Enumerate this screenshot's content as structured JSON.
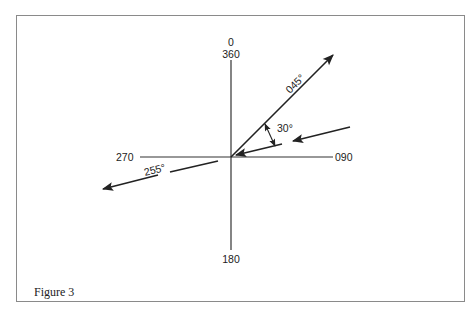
{
  "figure": {
    "caption": "Figure 3",
    "compass_labels": {
      "north_top": "0",
      "north_bottom": "360",
      "east": "090",
      "south": "180",
      "west": "270"
    },
    "vectors": [
      {
        "label": "045°",
        "bearing": 45,
        "direction": "outward from origin"
      },
      {
        "label": "255°",
        "bearing": 255,
        "direction": "outward from origin (dashed)"
      },
      {
        "label": "incoming",
        "bearing": 75,
        "direction": "toward origin (dashed)"
      }
    ],
    "angle_annotation": "30°",
    "colors": {
      "ink": "#222222",
      "frame": "#8a8a8a",
      "background": "#ffffff"
    }
  }
}
